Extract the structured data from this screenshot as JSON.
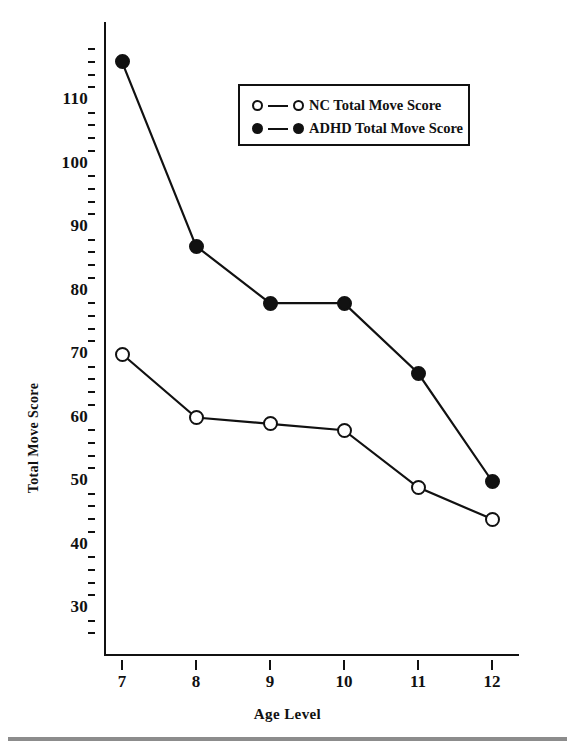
{
  "chart_data": {
    "type": "line",
    "title": "",
    "xlabel": "Age Level",
    "ylabel": "Total Move Score",
    "categories": [
      7,
      8,
      9,
      10,
      11,
      12
    ],
    "x": [
      7,
      8,
      9,
      10,
      11,
      12
    ],
    "xtick_labels": [
      "7",
      "8",
      "9",
      "10",
      "11",
      "12"
    ],
    "ytick_labels": [
      "110",
      "100",
      "90",
      "80",
      "70",
      "60",
      "50",
      "40",
      "30"
    ],
    "ytick_values": [
      110,
      100,
      90,
      80,
      70,
      60,
      50,
      40,
      30
    ],
    "ylim": [
      26,
      120
    ],
    "xlim": [
      6.6,
      12.5
    ],
    "grid": false,
    "minor_ticks": true,
    "legend_position": "upper-center",
    "series": [
      {
        "name": "NC Total Move Score",
        "marker": "open-circle",
        "color": "#111111",
        "values": [
          70,
          60,
          59,
          58,
          49,
          44
        ]
      },
      {
        "name": "ADHD Total Move Score",
        "marker": "filled-circle",
        "color": "#111111",
        "values": [
          116,
          87,
          78,
          78,
          67,
          50
        ]
      }
    ]
  },
  "legend": {
    "items": [
      {
        "label": "NC Total Move Score",
        "marker": "open-circle"
      },
      {
        "label": "ADHD Total Move Score",
        "marker": "filled-circle"
      }
    ]
  },
  "axes": {
    "x_title": "Age Level",
    "y_title": "Total Move Score"
  }
}
